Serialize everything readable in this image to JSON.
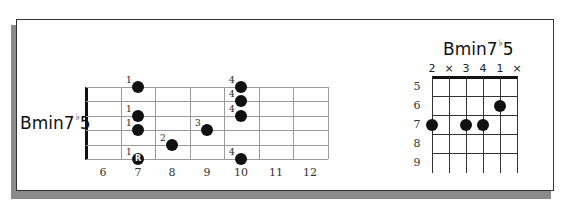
{
  "neck_diagram": {
    "chord_name": "Bmin7",
    "chord_flat": "♭",
    "chord_suffix": "5",
    "fret_numbers": [
      "6",
      "7",
      "8",
      "9",
      "10",
      "11",
      "12"
    ],
    "notes": [
      {
        "string": 1,
        "fret": 7,
        "finger": "1",
        "root": false
      },
      {
        "string": 3,
        "fret": 7,
        "finger": "1",
        "root": false
      },
      {
        "string": 4,
        "fret": 7,
        "finger": "1",
        "root": false
      },
      {
        "string": 6,
        "fret": 7,
        "finger": "1",
        "root": true,
        "label": "R"
      },
      {
        "string": 5,
        "fret": 8,
        "finger": "2",
        "root": false
      },
      {
        "string": 4,
        "fret": 9,
        "finger": "3",
        "root": false
      },
      {
        "string": 1,
        "fret": 10,
        "finger": "4",
        "root": false
      },
      {
        "string": 2,
        "fret": 10,
        "finger": "4",
        "root": false
      },
      {
        "string": 3,
        "fret": 10,
        "finger": "4",
        "root": false
      },
      {
        "string": 6,
        "fret": 10,
        "finger": "4",
        "root": false
      }
    ]
  },
  "chord_box": {
    "chord_name": "Bmin7",
    "chord_flat": "♭",
    "chord_suffix": "5",
    "string_marks": [
      "2",
      "×",
      "3",
      "4",
      "1",
      "×"
    ],
    "fret_numbers": [
      "5",
      "6",
      "7",
      "8",
      "9"
    ],
    "dots": [
      {
        "string": 1,
        "fret": 7
      },
      {
        "string": 3,
        "fret": 7
      },
      {
        "string": 4,
        "fret": 7
      },
      {
        "string": 5,
        "fret": 6
      }
    ]
  }
}
